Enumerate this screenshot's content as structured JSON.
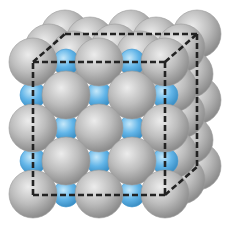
{
  "diagram": {
    "type": "crystal-lattice",
    "colors": {
      "background": "#ffffff",
      "large_sphere": "#b9b9b9",
      "large_sphere_highlight": "#e6e6e6",
      "large_sphere_shadow": "#8a8a8a",
      "small_sphere": "#5fb3e6",
      "small_sphere_highlight": "#bfe4f8",
      "small_sphere_shadow": "#3a8fc4",
      "cube_outline": "#222222"
    },
    "cube": {
      "front_top_left": [
        33,
        62
      ],
      "front_bottom_right": [
        165,
        195
      ],
      "depth_offset": [
        32,
        -28
      ]
    },
    "large_radius": 24,
    "small_radius": 13,
    "grid_spacing": 33
  }
}
